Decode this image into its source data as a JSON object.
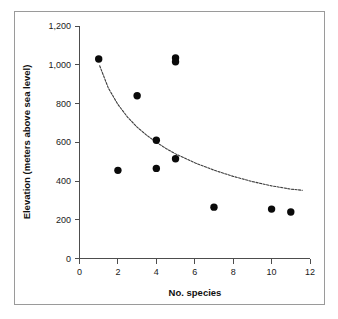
{
  "chart_data": {
    "type": "scatter",
    "title": "",
    "xlabel": "No. species",
    "ylabel": "Elevation (meters above sea level)",
    "xlim": [
      0,
      12
    ],
    "ylim": [
      0,
      1200
    ],
    "xticks": [
      0,
      2,
      4,
      6,
      8,
      10,
      12
    ],
    "xtick_labels": [
      "0",
      "2",
      "4",
      "6",
      "8",
      "10",
      "12"
    ],
    "yticks": [
      0,
      200,
      400,
      600,
      800,
      1000,
      1200
    ],
    "ytick_labels": [
      "0",
      "200",
      "400",
      "600",
      "800",
      "1,000",
      "1,200"
    ],
    "grid": false,
    "legend": "none",
    "marker": "filled-circle",
    "marker_color": "#0a0a0a",
    "points": [
      {
        "x": 1,
        "y": 1030
      },
      {
        "x": 2,
        "y": 455
      },
      {
        "x": 3,
        "y": 840
      },
      {
        "x": 4,
        "y": 610
      },
      {
        "x": 4,
        "y": 465
      },
      {
        "x": 5,
        "y": 1035
      },
      {
        "x": 5,
        "y": 1015
      },
      {
        "x": 5,
        "y": 515
      },
      {
        "x": 7,
        "y": 265
      },
      {
        "x": 10,
        "y": 255
      },
      {
        "x": 11,
        "y": 240
      }
    ],
    "trendline": {
      "style": "dotted",
      "color": "#3d3d3d",
      "description": "decreasing logarithmic fit",
      "points": [
        {
          "x": 1.05,
          "y": 995
        },
        {
          "x": 1.5,
          "y": 880
        },
        {
          "x": 2.0,
          "y": 795
        },
        {
          "x": 2.5,
          "y": 730
        },
        {
          "x": 3.0,
          "y": 678
        },
        {
          "x": 3.5,
          "y": 636
        },
        {
          "x": 4.0,
          "y": 600
        },
        {
          "x": 4.5,
          "y": 568
        },
        {
          "x": 5.0,
          "y": 540
        },
        {
          "x": 6.0,
          "y": 494
        },
        {
          "x": 7.0,
          "y": 456
        },
        {
          "x": 8.0,
          "y": 424
        },
        {
          "x": 9.0,
          "y": 397
        },
        {
          "x": 10.0,
          "y": 375
        },
        {
          "x": 11.0,
          "y": 358
        },
        {
          "x": 11.6,
          "y": 352
        }
      ]
    }
  },
  "axes": {
    "x_title": "No. species",
    "y_title": "Elevation (meters above sea level)"
  }
}
